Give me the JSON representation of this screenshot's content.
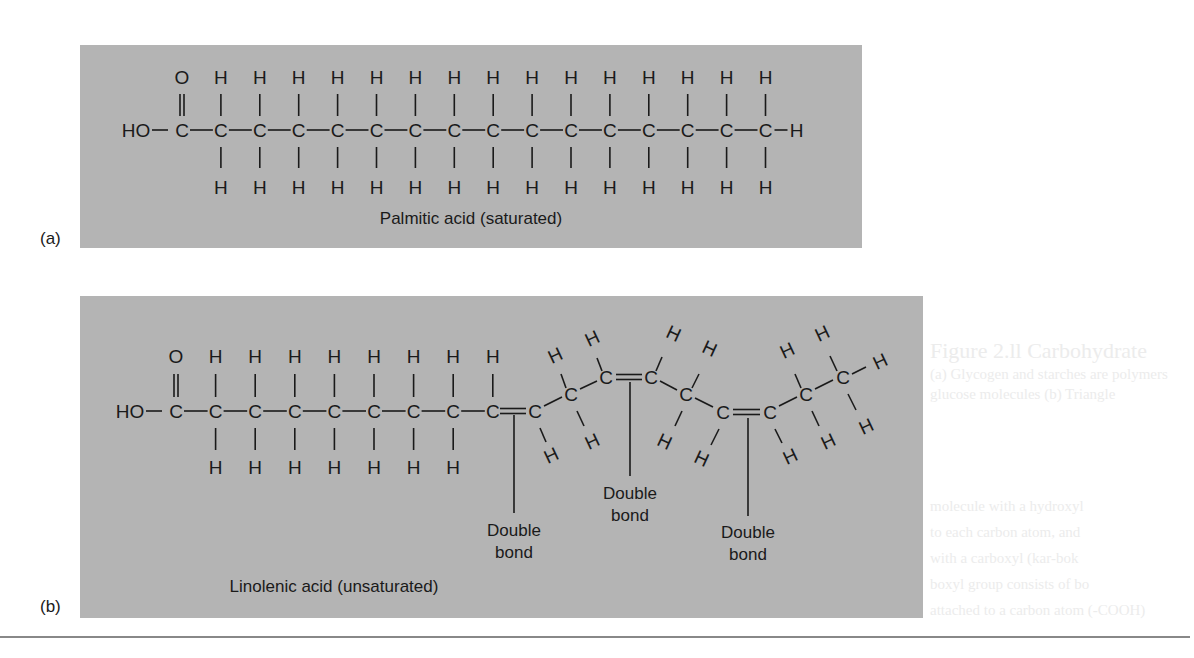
{
  "background_bleed": {
    "title": "Figure 2.ll Carbohydrate",
    "lines": [
      "(a) Glycogen and starches are polymers",
      "glucose molecules (b) Triangle",
      "",
      "molecule with a hydroxyl",
      "to each carbon atom, and",
      "with a carboxyl (kar-bok",
      "boxyl group consists of bo",
      "attached to a carbon atom (-COOH)"
    ]
  },
  "panel_a": {
    "label": "(a)",
    "caption": "Palmitic acid (saturated)",
    "atoms": {
      "O": "O",
      "H": "H",
      "C": "C",
      "HO": "HO"
    },
    "carbon_count": 16,
    "bond_type": "single"
  },
  "panel_b": {
    "label": "(b)",
    "caption": "Linolenic acid (unsaturated)",
    "carbon_count": 18,
    "double_bond_label_line1": "Double",
    "double_bond_label_line2": "bond",
    "double_bonds": [
      {
        "position": "C9=C10",
        "label": "Double bond"
      },
      {
        "position": "C12=C13",
        "label": "Double bond"
      },
      {
        "position": "C15=C16",
        "label": "Double bond"
      }
    ]
  },
  "colors": {
    "panel_gray": "#b4b4b4",
    "ink": "#1a1a1a",
    "ghost": "#ececec"
  }
}
